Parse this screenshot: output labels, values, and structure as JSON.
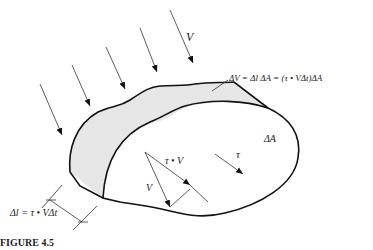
{
  "figure": {
    "caption": "FIGURE 4.5",
    "labels": {
      "flow_velocity": "V",
      "volume_equation": "ΔV = Δl ΔA = (τ • VΔt)ΔA",
      "area": "ΔA",
      "tangent_vector": "τ",
      "projection": "τ • V",
      "velocity_in_triangle": "V",
      "length_equation": "Δl = τ • VΔt"
    },
    "colors": {
      "stroke": "#111111",
      "shaded_region": "#e6e6e6",
      "background": "#ffffff"
    },
    "incoming_arrow_count": 5
  }
}
